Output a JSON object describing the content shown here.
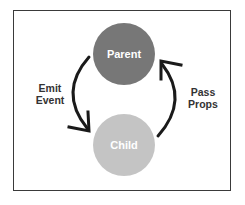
{
  "diagram": {
    "type": "cycle",
    "nodes": [
      {
        "id": "parent",
        "label": "Parent",
        "color": "#777777",
        "text_color": "#ffffff"
      },
      {
        "id": "child",
        "label": "Child",
        "color": "#c4c4c4",
        "text_color": "#ffffff"
      }
    ],
    "edges": [
      {
        "from": "parent",
        "to": "child",
        "label_line1": "Emit",
        "label_line2": "Event"
      },
      {
        "from": "child",
        "to": "parent",
        "label_line1": "Pass",
        "label_line2": "Props"
      }
    ],
    "arrow_color": "#1a1a1a",
    "border_color": "#3a3a3a"
  }
}
